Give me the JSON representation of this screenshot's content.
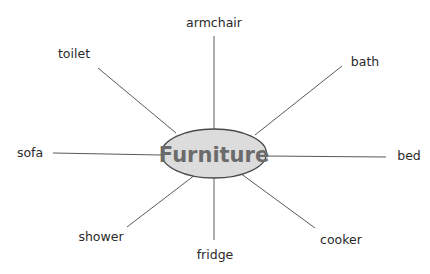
{
  "diagram": {
    "type": "spider / word map",
    "center": {
      "label": "Furniture",
      "cx": 214,
      "cy": 153.5,
      "rx": 52.5,
      "ry": 24.5,
      "fill": "#dcdcdc",
      "stroke": "#4a4a4a"
    },
    "branches": [
      {
        "label": "armchair",
        "text_x": 214,
        "text_y": 27,
        "anchor": "middle",
        "line": [
          214,
          36,
          214,
          129
        ]
      },
      {
        "label": "toilet",
        "text_x": 74,
        "text_y": 58,
        "anchor": "middle",
        "line": [
          98,
          68,
          176,
          133
        ]
      },
      {
        "label": "bath",
        "text_x": 365,
        "text_y": 66,
        "anchor": "middle",
        "line": [
          342,
          66,
          255,
          135
        ]
      },
      {
        "label": "sofa",
        "text_x": 30,
        "text_y": 157,
        "anchor": "middle",
        "line": [
          53,
          153,
          161,
          155
        ]
      },
      {
        "label": "bed",
        "text_x": 409,
        "text_y": 160,
        "anchor": "middle",
        "line": [
          386,
          157,
          266,
          156
        ]
      },
      {
        "label": "shower",
        "text_x": 101,
        "text_y": 241,
        "anchor": "middle",
        "line": [
          127,
          227,
          195,
          175
        ]
      },
      {
        "label": "fridge",
        "text_x": 215,
        "text_y": 259,
        "anchor": "middle",
        "line": [
          214,
          178,
          214,
          240
        ]
      },
      {
        "label": "cooker",
        "text_x": 341,
        "text_y": 244,
        "anchor": "middle",
        "line": [
          315,
          228,
          240,
          173
        ]
      }
    ]
  }
}
